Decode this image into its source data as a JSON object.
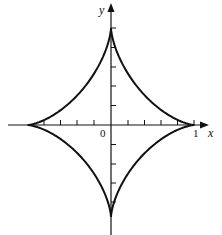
{
  "figure": {
    "curve_type": "astroid",
    "stroke_color": "#111111",
    "background": "#ffffff",
    "axes": {
      "x_label": "x",
      "y_label": "y",
      "origin_label": "0",
      "x_tick_label": "1",
      "x_ticks_per_half": 5,
      "y_ticks_per_half": 5,
      "x_range": [
        -1,
        1
      ],
      "y_range": [
        -1,
        1
      ]
    },
    "cusps": [
      {
        "x": 1,
        "y": 0
      },
      {
        "x": 0,
        "y": 1
      },
      {
        "x": -1,
        "y": 0
      },
      {
        "x": 0,
        "y": -1
      }
    ]
  }
}
